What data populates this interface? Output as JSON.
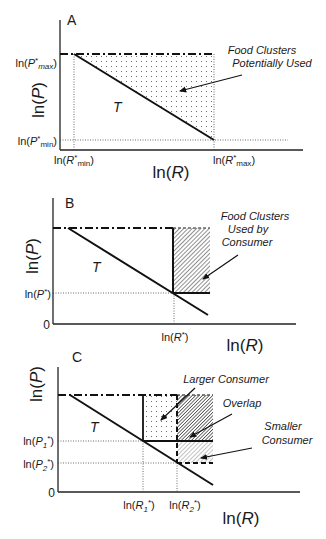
{
  "panels": {
    "A": {
      "letter": "A",
      "ylabel": "ln(P)",
      "xlabel": "ln(R)",
      "y_ticks": [
        "ln(P*max)",
        "ln(P*min)"
      ],
      "x_ticks": [
        "ln(R*min)",
        "ln(R*max)"
      ],
      "curve_label": "T",
      "annotation_lines": [
        "Food Clusters",
        "Potentially Used"
      ]
    },
    "B": {
      "letter": "B",
      "ylabel": "ln(P)",
      "xlabel": "ln(R)",
      "origin": "0",
      "y_ticks": [
        "ln(P*)"
      ],
      "x_ticks": [
        "ln(R*)"
      ],
      "curve_label": "T",
      "annotation_lines": [
        "Food Clusters",
        "Used by",
        "Consumer"
      ]
    },
    "C": {
      "letter": "C",
      "ylabel": "ln(P)",
      "xlabel": "ln(R)",
      "origin": "0",
      "y_ticks": [
        "ln(P1*)",
        "ln(P2*)"
      ],
      "x_ticks": [
        "ln(R1*)",
        "ln(R2*)"
      ],
      "curve_label": "T",
      "annotations": {
        "larger": "Larger Consumer",
        "overlap": "Overlap",
        "smaller_lines": [
          "Smaller",
          "Consumer"
        ]
      }
    }
  }
}
